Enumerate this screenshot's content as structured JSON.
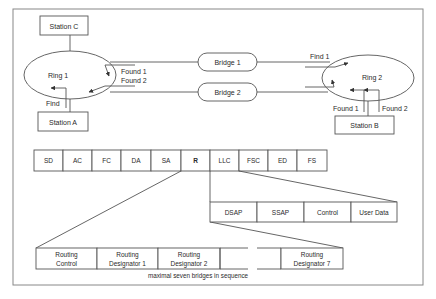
{
  "stations": {
    "a": "Station A",
    "b": "Station B",
    "c": "Station C"
  },
  "rings": {
    "ring1": "Ring 1",
    "ring2": "Ring 2"
  },
  "bridges": {
    "bridge1": "Bridge 1",
    "bridge2": "Bridge 2"
  },
  "ring1_labels": {
    "found1": "Found 1",
    "found2": "Found 2",
    "find": "Find"
  },
  "ring2_labels": {
    "find1": "Find 1",
    "found1": "Found 1",
    "found2": "Found 2"
  },
  "frame_fields": [
    "SD",
    "AC",
    "FC",
    "DA",
    "SA",
    "R",
    "LLC",
    "FSC",
    "ED",
    "FS"
  ],
  "llc_fields": [
    "DSAP",
    "SSAP",
    "Control",
    "User Data"
  ],
  "routing_fields": {
    "control_l1": "Routing",
    "control_l2": "Control",
    "rd1_l1": "Routing",
    "rd1_l2": "Designator 1",
    "rd2_l1": "Routing",
    "rd2_l2": "Designator 2",
    "rd7_l1": "Routing",
    "rd7_l2": "Designator 7"
  },
  "routing_caption": "maximal seven bridges in sequence",
  "colors": {
    "line": "#555555",
    "text": "#2a2a2a",
    "background": "#ffffff"
  }
}
